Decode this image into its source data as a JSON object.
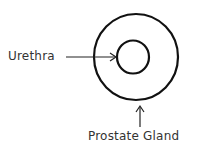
{
  "diagram": {
    "labels": {
      "urethra": "Urethra",
      "prostate": "Prostate Gland"
    },
    "colors": {
      "stroke": "#111111",
      "text": "#333333",
      "background": "#ffffff"
    }
  }
}
